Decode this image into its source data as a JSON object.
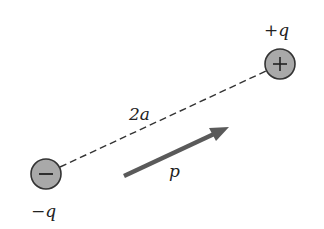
{
  "diagram": {
    "charges": [
      {
        "id": "positive",
        "label": "+q",
        "sign": "+",
        "sign_label_prefix": "+",
        "sign_label_var": "q",
        "cx": 280,
        "cy": 64,
        "r": 15
      },
      {
        "id": "negative",
        "label": "−q",
        "sign": "−",
        "sign_label_prefix": "−",
        "sign_label_var": "q",
        "cx": 46,
        "cy": 174,
        "r": 15
      }
    ],
    "separation": {
      "label": "2a",
      "style": "dashed"
    },
    "dipole_moment": {
      "label": "p",
      "x1": 124,
      "y1": 176,
      "x2": 228,
      "y2": 128
    },
    "colors": {
      "charge_fill": "#a9a9a9",
      "charge_stroke": "#333333",
      "line": "#333333",
      "arrow": "#5a5a5a",
      "text": "#222222"
    }
  }
}
